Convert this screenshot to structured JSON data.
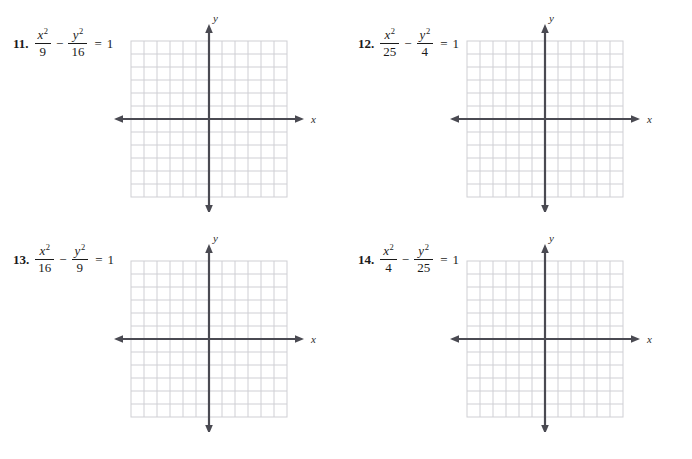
{
  "page": {
    "width": 692,
    "height": 459,
    "background": "#ffffff"
  },
  "style": {
    "grid_line_color": "#cfcfd4",
    "axis_color": "#4a4a52",
    "text_color": "#1a1a1a"
  },
  "graph": {
    "columns": 12,
    "rows": 12,
    "cell_size": 13,
    "x_axis_label": "x",
    "y_axis_label": "y",
    "has_arrowheads": true,
    "gridlines_visible": true
  },
  "problems": [
    {
      "number": "11.",
      "equation": {
        "term1": {
          "numerator": "x",
          "exponent": "2",
          "denominator": "9"
        },
        "operator": "−",
        "term2": {
          "numerator": "y",
          "exponent": "2",
          "denominator": "16"
        },
        "equals": "=",
        "rhs": "1"
      }
    },
    {
      "number": "12.",
      "equation": {
        "term1": {
          "numerator": "x",
          "exponent": "2",
          "denominator": "25"
        },
        "operator": "−",
        "term2": {
          "numerator": "y",
          "exponent": "2",
          "denominator": "4"
        },
        "equals": "=",
        "rhs": "1"
      }
    },
    {
      "number": "13.",
      "equation": {
        "term1": {
          "numerator": "x",
          "exponent": "2",
          "denominator": "16"
        },
        "operator": "−",
        "term2": {
          "numerator": "y",
          "exponent": "2",
          "denominator": "9"
        },
        "equals": "=",
        "rhs": "1"
      }
    },
    {
      "number": "14.",
      "equation": {
        "term1": {
          "numerator": "x",
          "exponent": "2",
          "denominator": "4"
        },
        "operator": "−",
        "term2": {
          "numerator": "y",
          "exponent": "2",
          "denominator": "25"
        },
        "equals": "=",
        "rhs": "1"
      }
    }
  ]
}
